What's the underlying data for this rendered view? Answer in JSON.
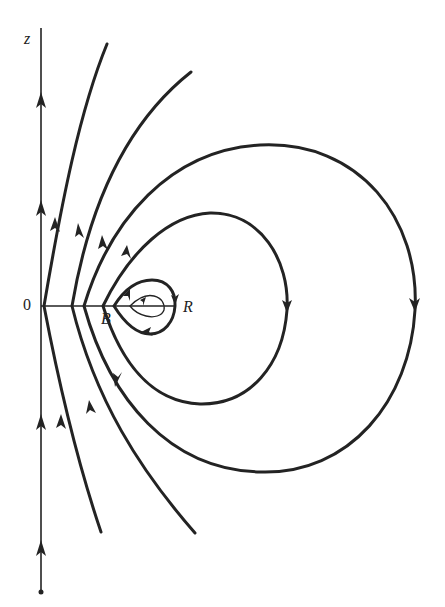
{
  "figure": {
    "type": "streamline-diagram",
    "labels": {
      "axis_z": "z",
      "origin": "0",
      "point_b": "B",
      "point_r": "R"
    },
    "colors": {
      "stroke": "#232323",
      "background": "#ffffff"
    },
    "curves": {
      "open_lines_count": 4,
      "closed_loops_count": 4,
      "axis_arrows": "upward",
      "loop_direction": "clockwise (down on outer right side)"
    }
  }
}
